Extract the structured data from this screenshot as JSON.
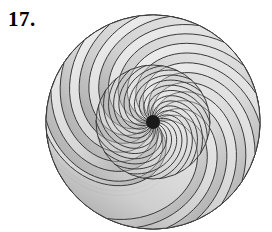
{
  "page": {
    "background_color": "#ffffff",
    "width": 272,
    "height": 232
  },
  "label": {
    "number": "17.",
    "color": "#000000"
  },
  "figure": {
    "caption": "17.",
    "center": {
      "x": 153,
      "y": 122
    },
    "stroke_color": "#3a3a3a",
    "stroke_width": 1.0,
    "center_dot_color": "#1a1a1a",
    "center_dot_radius": 7,
    "inner_circle_radius": 57,
    "outer_radius": 107,
    "petal_count": 22,
    "petal_fill_light": "#efefef",
    "petal_fill_dark": "#a6a6a6",
    "inner_fill_light": "#f2f2f2",
    "inner_fill_dark": "#b4b4b4",
    "spiral_turn_degrees": 132,
    "petal_span_degrees": 58,
    "rotation_offset_degrees": 0
  },
  "chart_data": {
    "type": "scatter",
    "title": "17.",
    "xlabel": "",
    "ylabel": "",
    "symmetry_order": 22,
    "categories": [
      "petal"
    ],
    "values": [
      22
    ],
    "series": [
      {
        "name": "petals",
        "values": [
          22
        ]
      },
      {
        "name": "spiral_arcs",
        "values": [
          22
        ]
      }
    ],
    "grid": false,
    "legend": "none"
  }
}
